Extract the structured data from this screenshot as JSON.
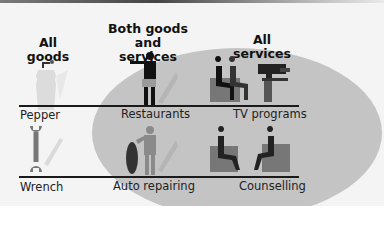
{
  "diagram": {
    "headings": {
      "goods": "All goods",
      "both": "Both goods\nand services",
      "both_line1": "Both goods",
      "both_line2": "and services",
      "services": "All services"
    },
    "rows": [
      {
        "goods": "Pepper",
        "both": "Restaurants",
        "services": "TV programs"
      },
      {
        "goods": "Wrench",
        "both": "Auto repairing",
        "services": "Counselling"
      }
    ],
    "icons": [
      "pepper-grinder-icon",
      "waiter-icon",
      "tv-studio-icon",
      "wrench-icon",
      "mechanic-tire-icon",
      "counselling-icon"
    ],
    "colors": {
      "background": "#f4f4f4",
      "ellipse": "#c4c4c4",
      "ink": "#1a1a1a",
      "grey_icon": "#7d7d7d"
    }
  }
}
